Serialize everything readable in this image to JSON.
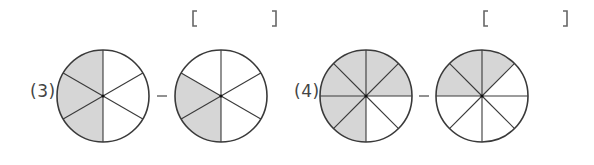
{
  "problems": [
    {
      "number_label": "(3)",
      "operator": "−",
      "answer_bracket": {
        "open": "[",
        "close": "]",
        "value": ""
      },
      "circles": [
        {
          "sectors": 6,
          "shaded_sectors": 3,
          "shaded_from_deg": 90,
          "shaded_to_deg": 270
        },
        {
          "sectors": 6,
          "shaded_sectors": 2,
          "shaded_from_deg": 150,
          "shaded_to_deg": 270
        }
      ]
    },
    {
      "number_label": "(4)",
      "operator": "−",
      "answer_bracket": {
        "open": "[",
        "close": "]",
        "value": ""
      },
      "circles": [
        {
          "sectors": 8,
          "shaded_sectors": 6,
          "shaded_from_deg": 0,
          "shaded_to_deg": 270
        },
        {
          "sectors": 8,
          "shaded_sectors": 3,
          "shaded_from_deg": 45,
          "shaded_to_deg": 180
        }
      ]
    }
  ],
  "colors": {
    "shade": "#d6d6d6",
    "stroke": "#3a3a3a",
    "bracket": "#666666"
  }
}
